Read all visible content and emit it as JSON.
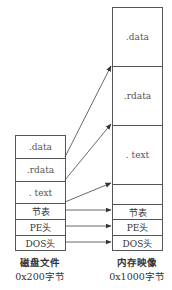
{
  "disk": {
    "title": "磁盘文件",
    "size": "0x200字节",
    "sections": [
      ".data",
      ".rdata",
      ". text",
      "节表",
      "PE头",
      "DOS头"
    ]
  },
  "memory": {
    "title": "内存映像",
    "size": "0x1000字节",
    "sections": [
      ".data",
      ".rdata",
      ". text",
      "节表",
      "PE头",
      "DOS头"
    ]
  },
  "mappings": [
    {
      "from": ".data",
      "to": ".data"
    },
    {
      "from": ".rdata",
      "to": ".rdata"
    },
    {
      "from": ". text",
      "to": ". text"
    },
    {
      "from": "节表",
      "to": "节表"
    },
    {
      "from": "PE头",
      "to": "PE头"
    },
    {
      "from": "DOS头",
      "to": "DOS头"
    }
  ]
}
